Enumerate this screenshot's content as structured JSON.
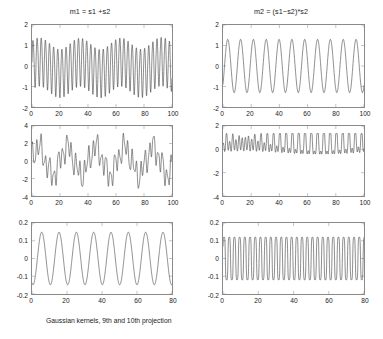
{
  "figure": {
    "caption": "Gaussian kernels, 9th and 10th projection",
    "background": "#ffffff",
    "line_color": "#303030",
    "axis_color": "#8a8a8a"
  },
  "panels": [
    {
      "id": "mixture-1",
      "title": "m1 = s1 +s2",
      "y_ticks": [
        "-2",
        "-1",
        "0",
        "1",
        "2"
      ],
      "x_ticks": [
        "0",
        "20",
        "40",
        "60",
        "80",
        "100"
      ]
    },
    {
      "id": "mixture-2",
      "title": "m2 = (s1−s2)*s2",
      "y_ticks": [
        "-2",
        "-1",
        "0",
        "1",
        "2"
      ],
      "x_ticks": [
        "0",
        "20",
        "40",
        "60",
        "80",
        "100"
      ]
    },
    {
      "id": "projection-9-source",
      "title": "",
      "y_ticks": [
        "-4",
        "-2",
        "0",
        "2",
        "4"
      ],
      "x_ticks": [
        "0",
        "20",
        "40",
        "60",
        "80",
        "100"
      ]
    },
    {
      "id": "projection-10-source",
      "title": "",
      "y_ticks": [
        "-4",
        "-2",
        "0",
        "2"
      ],
      "x_ticks": [
        "0",
        "20",
        "40",
        "60",
        "80",
        "100"
      ]
    },
    {
      "id": "projection-9",
      "title": "",
      "y_ticks": [
        "-0.2",
        "-0.1",
        "0",
        "0.1",
        "0.2"
      ],
      "x_ticks": [
        "0",
        "20",
        "40",
        "60",
        "80"
      ]
    },
    {
      "id": "projection-10",
      "title": "",
      "y_ticks": [
        "-0.2",
        "-0.1",
        "0",
        "0.1",
        "0.2"
      ],
      "x_ticks": [
        "0",
        "20",
        "40",
        "60",
        "80"
      ]
    }
  ],
  "chart_data": [
    {
      "type": "line",
      "id": "mixture-1",
      "title": "m1 = s1 +s2",
      "xlabel": "",
      "ylabel": "",
      "xlim": [
        0,
        100
      ],
      "ylim": [
        -2,
        2
      ],
      "xticks": [
        0,
        20,
        40,
        60,
        80,
        100
      ],
      "yticks": [
        -2,
        -1,
        0,
        1,
        2
      ],
      "grid": false,
      "legend": "none",
      "description": "Sum of two sinusoids s1+s2; dense oscillation with roughly 34 visible cycles, envelope between about -1.45 and +1.45",
      "series": [
        {
          "name": "m1",
          "formula": "sin(2*pi*x/2.95) + 0.45*sin(2*pi*x/29)",
          "amplitude": 1.45,
          "period": 2.95,
          "n_points": 1000
        }
      ]
    },
    {
      "type": "line",
      "id": "mixture-2",
      "title": "m2 = (s1−s2)*s2",
      "xlabel": "",
      "ylabel": "",
      "xlim": [
        0,
        100
      ],
      "ylim": [
        -2,
        2
      ],
      "xticks": [
        0,
        20,
        40,
        60,
        80,
        100
      ],
      "yticks": [
        -2,
        -1,
        0,
        1,
        2
      ],
      "grid": false,
      "legend": "none",
      "description": "Smooth sinusoid with about 11 cycles, amplitude roughly 1.3",
      "series": [
        {
          "name": "m2",
          "formula": "1.3*sin(2*pi*x/9.1 - 0.6)",
          "amplitude": 1.3,
          "period": 9.1,
          "n_points": 1000
        }
      ]
    },
    {
      "type": "line",
      "id": "projection-9-source",
      "title": "",
      "xlabel": "",
      "ylabel": "",
      "xlim": [
        0,
        100
      ],
      "ylim": [
        -4,
        4
      ],
      "xticks": [
        0,
        20,
        40,
        60,
        80,
        100
      ],
      "yticks": [
        -4,
        -2,
        0,
        2,
        4
      ],
      "grid": false,
      "legend": "none",
      "description": "Irregular multi-frequency waveform oscillating mostly between -3 and +3",
      "series": [
        {
          "name": "p9src",
          "formula": "1.6*sin(2*pi*x/20.5) + 1.15*sin(2*pi*x/3.1+1.1) + 0.6*sin(2*pi*x/6.7+2.3)",
          "amplitude": 3.0,
          "n_points": 1000
        }
      ]
    },
    {
      "type": "line",
      "id": "projection-10-source",
      "title": "",
      "xlabel": "",
      "ylabel": "",
      "xlim": [
        0,
        100
      ],
      "ylim": [
        -4,
        2
      ],
      "xticks": [
        0,
        20,
        40,
        60,
        80,
        100
      ],
      "yticks": [
        -4,
        -2,
        0,
        2
      ],
      "grid": false,
      "legend": "none",
      "description": "Clipped-looking waveform riding near +1 with deep periodic negative spikes reaching about -2.7",
      "series": [
        {
          "name": "p10src",
          "amplitude": 2.7,
          "n_points": 1000
        }
      ]
    },
    {
      "type": "line",
      "id": "projection-9",
      "title": "",
      "xlabel": "",
      "ylabel": "",
      "xlim": [
        0,
        80
      ],
      "ylim": [
        -0.2,
        0.2
      ],
      "xticks": [
        0,
        20,
        40,
        60,
        80
      ],
      "yticks": [
        -0.2,
        -0.1,
        0,
        0.1,
        0.2
      ],
      "grid": false,
      "legend": "none",
      "description": "Clean sinusoid, about 8 cycles over 0-80, amplitude about 0.15",
      "series": [
        {
          "name": "proj9",
          "formula": "0.148*sin(2*pi*x/9.9 - 1.9)",
          "amplitude": 0.148,
          "period": 9.9,
          "n_points": 1000
        }
      ]
    },
    {
      "type": "line",
      "id": "projection-10",
      "title": "",
      "xlabel": "",
      "ylabel": "",
      "xlim": [
        0,
        80
      ],
      "ylim": [
        -0.2,
        0.2
      ],
      "xticks": [
        0,
        20,
        40,
        60,
        80
      ],
      "yticks": [
        -0.2,
        -0.1,
        0,
        0.1,
        0.2
      ],
      "grid": false,
      "legend": "none",
      "description": "High frequency near-square sinusoid, about 27 cycles over 0-80, amplitude about 0.125",
      "series": [
        {
          "name": "proj10",
          "formula": "0.125*sin(2*pi*x/2.95)",
          "amplitude": 0.125,
          "period": 2.95,
          "n_points": 1000
        }
      ]
    }
  ]
}
